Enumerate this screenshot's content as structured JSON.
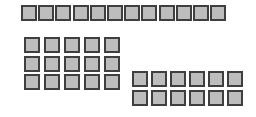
{
  "diagram": {
    "colors": {
      "fill": "#bdbdbd",
      "border": "#3f3f3f",
      "background": "#ffffff"
    },
    "groups": [
      {
        "name": "top-row",
        "rows": 1,
        "cols": 12,
        "count": 12,
        "x": 21,
        "y": 5,
        "pitch_x": 17.2,
        "pitch_y": 0,
        "size": 16
      },
      {
        "name": "left-block",
        "rows": 3,
        "cols": 5,
        "count": 15,
        "x": 24,
        "y": 37,
        "pitch_x": 20,
        "pitch_y": 18.5,
        "size": 16
      },
      {
        "name": "right-block",
        "rows": 2,
        "cols": 6,
        "count": 12,
        "x": 132,
        "y": 71,
        "pitch_x": 19,
        "pitch_y": 19,
        "size": 16
      }
    ]
  }
}
